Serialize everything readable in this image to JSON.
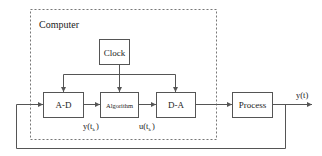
{
  "diagram": {
    "type": "block-diagram",
    "container": {
      "label": "Computer",
      "style": "dashed"
    },
    "blocks": [
      {
        "id": "clock",
        "label": "Clock"
      },
      {
        "id": "ad",
        "label": "A-D"
      },
      {
        "id": "algorithm",
        "label": "Algorithm"
      },
      {
        "id": "da",
        "label": "D-A"
      },
      {
        "id": "process",
        "label": "Process"
      }
    ],
    "signals": {
      "sampled_output": {
        "base": "y(t",
        "sub": "k",
        "close": ")"
      },
      "control": {
        "base": "u(t",
        "sub": "k",
        "close": ")"
      },
      "output": "y(t)"
    },
    "edges": [
      {
        "from": "clock",
        "to": "ad"
      },
      {
        "from": "clock",
        "to": "algorithm"
      },
      {
        "from": "clock",
        "to": "da"
      },
      {
        "from": "ad",
        "to": "algorithm",
        "label": "y(tk)"
      },
      {
        "from": "algorithm",
        "to": "da",
        "label": "u(tk)"
      },
      {
        "from": "da",
        "to": "process"
      },
      {
        "from": "process",
        "to": "output",
        "label": "y(t)"
      },
      {
        "from": "process",
        "to": "ad",
        "type": "feedback"
      }
    ],
    "colors": {
      "line": "#555555",
      "dashed": "#777777",
      "text": "#222222"
    }
  }
}
